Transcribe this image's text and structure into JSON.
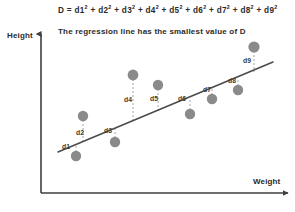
{
  "figure": {
    "title_prefix": "D = ",
    "subtitle": "The regression line has the smallest value of D",
    "y_axis_label": "Height",
    "x_axis_label": "Weight",
    "colors": {
      "point": "#8a8a8a",
      "line": "#4a4a4a",
      "axis": "#3f3f3f",
      "text": "#2b2b2b",
      "residual": "#9a9a9a",
      "background": "#ffffff"
    }
  },
  "chart_data": {
    "type": "scatter",
    "subtitle": "The regression line has the smallest value of D",
    "xlabel": "Weight",
    "ylabel": "Height",
    "grid": false,
    "legend": null,
    "axis_arrows": true,
    "tick_labels": [],
    "xlim": [
      41,
      295
    ],
    "ylim": [
      193,
      30
    ],
    "regression_line": {
      "x1": 58,
      "y1": 152,
      "x2": 273,
      "y2": 62,
      "label": "regression line"
    },
    "terms": [
      "d1²",
      "d2²",
      "d3²",
      "d4²",
      "d5²",
      "d6²",
      "d7²",
      "d8²",
      "d9²"
    ],
    "points": [
      {
        "name": "d1",
        "label": "d1",
        "x": 76,
        "y": 156,
        "line_y": 144,
        "label_x": 62,
        "label_y": 149,
        "radius": 5.2
      },
      {
        "name": "d2",
        "label": "d2",
        "x": 83,
        "y": 116,
        "line_y": 141,
        "label_x": 76,
        "label_y": 135,
        "radius": 5.2
      },
      {
        "name": "d3",
        "label": "d3",
        "x": 115,
        "y": 142,
        "line_y": 128,
        "label_x": 104,
        "label_y": 133,
        "radius": 5.2
      },
      {
        "name": "d4",
        "label": "d4",
        "x": 133,
        "y": 75,
        "line_y": 121,
        "label_x": 124,
        "label_y": 102,
        "radius": 5.4
      },
      {
        "name": "d5",
        "label": "d5",
        "x": 158,
        "y": 85,
        "line_y": 111,
        "label_x": 150,
        "label_y": 101,
        "radius": 5.2
      },
      {
        "name": "d6",
        "label": "d6",
        "x": 190,
        "y": 114,
        "line_y": 98,
        "label_x": 178,
        "label_y": 101,
        "radius": 5.2
      },
      {
        "name": "d7",
        "label": "d7",
        "x": 212,
        "y": 99,
        "line_y": 89,
        "label_x": 203,
        "label_y": 92,
        "radius": 5.2
      },
      {
        "name": "d8",
        "label": "d8",
        "x": 238,
        "y": 90,
        "line_y": 78,
        "label_x": 228,
        "label_y": 83,
        "radius": 5.2
      },
      {
        "name": "d9",
        "label": "d9",
        "x": 254,
        "y": 47,
        "line_y": 72,
        "label_x": 243,
        "label_y": 63,
        "radius": 5.6
      }
    ]
  }
}
